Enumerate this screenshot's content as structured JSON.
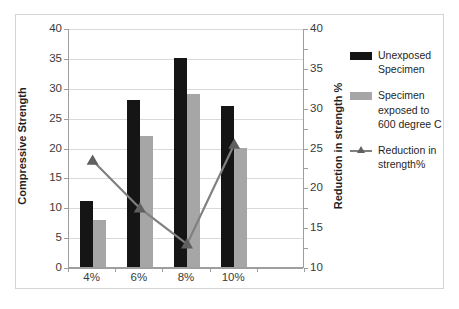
{
  "chart_data": {
    "type": "bar",
    "title": "",
    "xlabel": "",
    "ylabel": "Compressive Strength",
    "y2label": "Reduction in strength %",
    "categories": [
      "4%",
      "6%",
      "8%",
      "10%"
    ],
    "ylim": [
      0,
      40
    ],
    "yticks": [
      0,
      5,
      10,
      15,
      20,
      25,
      30,
      35,
      40
    ],
    "y2lim": [
      10,
      40
    ],
    "y2ticks": [
      10,
      15,
      20,
      25,
      30,
      35,
      40
    ],
    "grid": true,
    "legend_position": "right",
    "series": [
      {
        "name": "Unexposed Specimen",
        "type": "bar",
        "axis": "left",
        "color": "#151515",
        "values": [
          11,
          28,
          35,
          27
        ]
      },
      {
        "name": "Specimen exposed to 600 degree C",
        "type": "bar",
        "axis": "left",
        "color": "#a6a6a6",
        "values": [
          7.8,
          22,
          29,
          20
        ]
      },
      {
        "name": "Reduction in strength%",
        "type": "line",
        "axis": "right",
        "color": "#808080",
        "marker": "triangle",
        "values": [
          23.5,
          17.5,
          13,
          25.5
        ]
      }
    ]
  },
  "axes": {
    "left_title": "Compressive Strength",
    "right_title": "Reduction in strength %",
    "left_ticks": [
      "40",
      "35",
      "30",
      "25",
      "20",
      "15",
      "10",
      "5",
      "0"
    ],
    "right_ticks": [
      "40",
      "35",
      "30",
      "25",
      "20",
      "15",
      "10"
    ],
    "x_ticks": [
      "4%",
      "6%",
      "8%",
      "10%"
    ]
  },
  "legend": {
    "items": [
      {
        "label": "Unexposed Specimen",
        "key": "swatch-black"
      },
      {
        "label": "Specimen exposed to 600 degree C",
        "key": "swatch-gray"
      },
      {
        "label": "Reduction in strength%",
        "key": "line-marker"
      }
    ]
  }
}
